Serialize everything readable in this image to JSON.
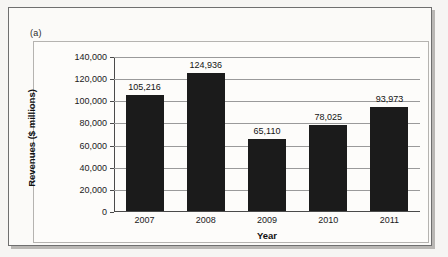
{
  "figure": {
    "panel_label": "(a)"
  },
  "chart_data": {
    "type": "bar",
    "title": "",
    "xlabel": "Year",
    "ylabel": "Revenues ($ millions)",
    "categories": [
      "2007",
      "2008",
      "2009",
      "2010",
      "2011"
    ],
    "values": [
      105216,
      124936,
      65110,
      78025,
      93973
    ],
    "value_labels": [
      "105,216",
      "124,936",
      "65,110",
      "78,025",
      "93,973"
    ],
    "ylim": [
      0,
      140000
    ],
    "ytick_values": [
      0,
      20000,
      40000,
      60000,
      80000,
      100000,
      120000,
      140000
    ],
    "ytick_labels": [
      "0",
      "20,000",
      "40,000",
      "60,000",
      "80,000",
      "100,000",
      "120,000",
      "140,000"
    ],
    "grid": true,
    "legend": false,
    "bar_color": "#1b1b1b",
    "gridline_color": "#9a9a9a",
    "axis_color": "#4a4a4a"
  }
}
